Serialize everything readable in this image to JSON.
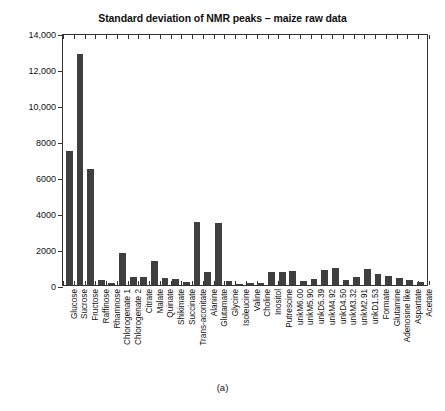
{
  "figure": {
    "caption": "(a)"
  },
  "chart_data": {
    "type": "bar",
    "title": "Standard deviation of NMR peaks – maize raw data",
    "xlabel": "",
    "ylabel": "",
    "ylim": [
      0,
      14000
    ],
    "yticks": [
      0,
      2000,
      4000,
      6000,
      8000,
      10000,
      12000,
      14000
    ],
    "ytick_labels": [
      "0",
      "2000",
      "4000",
      "6000",
      "8000",
      "10,000",
      "12,000",
      "14,000"
    ],
    "grid": false,
    "legend": null,
    "bar_color": "#3f3f3f",
    "categories": [
      "Glucose",
      "Sucrose",
      "Fructose",
      "Raffinose",
      "Rhamnose",
      "Chlorogenate 1",
      "Chlorogenate 2",
      "Citrate",
      "Malate",
      "Quinate",
      "Shikimate",
      "Succinate",
      "Trans-aconitate",
      "Alanine",
      "Glutamate",
      "Glycine",
      "Isoleucine",
      "Valine",
      "Choline",
      "Inositol",
      "Putrescine",
      "unkM6.00",
      "unkM5.90",
      "unkD5.39",
      "unkM4.92",
      "unkD4.50",
      "unkM3.32",
      "unkM2.91",
      "unkD1.53",
      "Formate",
      "Glutamine",
      "Adenosine like",
      "Aspartate",
      "Acetate"
    ],
    "values": [
      7450,
      12830,
      6450,
      300,
      130,
      1780,
      420,
      450,
      1330,
      400,
      330,
      170,
      3500,
      700,
      3450,
      250,
      50,
      90,
      100,
      700,
      750,
      780,
      250,
      330,
      850,
      950,
      280,
      430,
      900,
      620,
      500,
      400,
      280,
      180
    ]
  }
}
